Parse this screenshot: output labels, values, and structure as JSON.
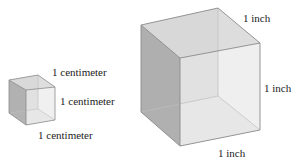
{
  "figure": {
    "small_cube": {
      "unit": "centimeter",
      "labels": {
        "top": "1 centimeter",
        "right": "1 centimeter",
        "bottom": "1 centimeter"
      }
    },
    "large_cube": {
      "unit": "inch",
      "labels": {
        "top": "1 inch",
        "right": "1 inch",
        "bottom": "1 inch"
      }
    },
    "colors": {
      "edge": "#8a8a8a",
      "left_face": "#a9a9a9",
      "top_face": "#d8d8d8",
      "front_face": "#e2e2e2",
      "bottom_face": "#ececec"
    }
  }
}
